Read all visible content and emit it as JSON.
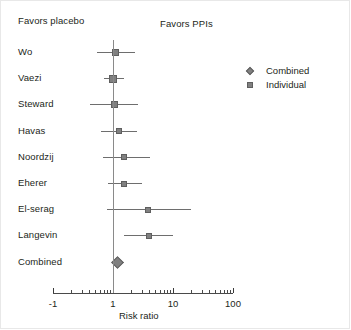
{
  "headers": {
    "left": "Favors placebo",
    "right": "Favors PPIs"
  },
  "legend": {
    "items": [
      {
        "label": "Combined",
        "marker": "diamond-marker",
        "color": "#808080"
      },
      {
        "label": "Individual",
        "marker": "square-marker",
        "color": "#808080"
      }
    ]
  },
  "axis": {
    "title": "Risk ratio",
    "scale": "log10",
    "tick_labels": [
      "-1",
      "1",
      "10",
      "100"
    ],
    "tick_values": [
      0.1,
      1,
      10,
      100
    ]
  },
  "chart_data": {
    "type": "scatter",
    "title": "",
    "subtitle": "",
    "xlabel": "Risk ratio",
    "ylabel": "",
    "xscale": "log",
    "xlim": [
      0.1,
      100
    ],
    "xticks": [
      0.1,
      1,
      10,
      100
    ],
    "xticklabels": [
      "-1",
      "1",
      "10",
      "100"
    ],
    "grid": false,
    "legend_position": "right",
    "null_line": 1,
    "annotations": [
      "Favors placebo",
      "Favors PPIs"
    ],
    "categories": [
      "Wo",
      "Vaezi",
      "Steward",
      "Havas",
      "Noordzij",
      "Eherer",
      "El-serag",
      "Langevin",
      "Combined"
    ],
    "series": [
      {
        "name": "Individual",
        "marker": "square",
        "color": "#808080",
        "points": [
          {
            "study": "Wo",
            "estimate": 1.1,
            "ci_low": 0.55,
            "ci_high": 2.3,
            "weight": 1.0
          },
          {
            "study": "Vaezi",
            "estimate": 1.0,
            "ci_low": 0.72,
            "ci_high": 1.5,
            "weight": 1.8
          },
          {
            "study": "Steward",
            "estimate": 1.05,
            "ci_low": 0.42,
            "ci_high": 2.6,
            "weight": 1.0
          },
          {
            "study": "Havas",
            "estimate": 1.25,
            "ci_low": 0.62,
            "ci_high": 2.5,
            "weight": 0.8
          },
          {
            "study": "Noordzij",
            "estimate": 1.55,
            "ci_low": 0.68,
            "ci_high": 4.2,
            "weight": 0.8
          },
          {
            "study": "Eherer",
            "estimate": 1.55,
            "ci_low": 0.82,
            "ci_high": 3.0,
            "weight": 0.8
          },
          {
            "study": "El-serag",
            "estimate": 3.9,
            "ci_low": 0.8,
            "ci_high": 20.0,
            "weight": 0.8
          },
          {
            "study": "Langevin",
            "estimate": 4.0,
            "ci_low": 1.55,
            "ci_high": 10.0,
            "weight": 0.8
          }
        ]
      },
      {
        "name": "Combined",
        "marker": "diamond",
        "color": "#808080",
        "points": [
          {
            "study": "Combined",
            "estimate": 1.2,
            "ci_low": 0.95,
            "ci_high": 1.5,
            "weight": 1.0
          }
        ]
      }
    ]
  }
}
